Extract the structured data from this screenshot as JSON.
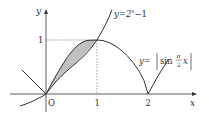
{
  "diagram": {
    "axes": {
      "x_label": "x",
      "y_label": "y",
      "origin_label": "O",
      "x_ticks": [
        "1",
        "2"
      ],
      "y_ticks": [
        "1"
      ]
    },
    "curves": [
      {
        "name": "exponential",
        "label_lhs": "y=2",
        "label_exp": "x",
        "label_rhs": "−1"
      },
      {
        "name": "abs-sine",
        "label_lhs": "y=",
        "label_fn": "sin",
        "label_num": "π",
        "label_den": "2",
        "label_var": "x"
      }
    ],
    "shaded_region": {
      "from_x": 0,
      "to_x": 1,
      "color": "#c0c0c0"
    },
    "colors": {
      "stroke": "#333333",
      "shade": "#c0c0c0",
      "guide": "#555555"
    }
  }
}
